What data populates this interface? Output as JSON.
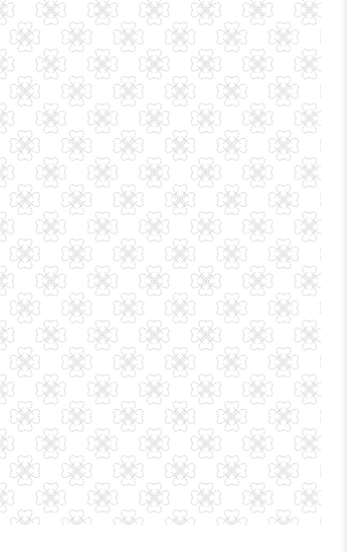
{
  "background": {
    "color": "#ffffff",
    "motif": "four-petal-flower-outline",
    "motif_color": "#c4c4c4",
    "period_x": 51.7,
    "period_y": 54.2,
    "first_center": [
      25,
      37
    ],
    "description": "Seamless repeating pattern of outlined four-petal flowers on white"
  }
}
